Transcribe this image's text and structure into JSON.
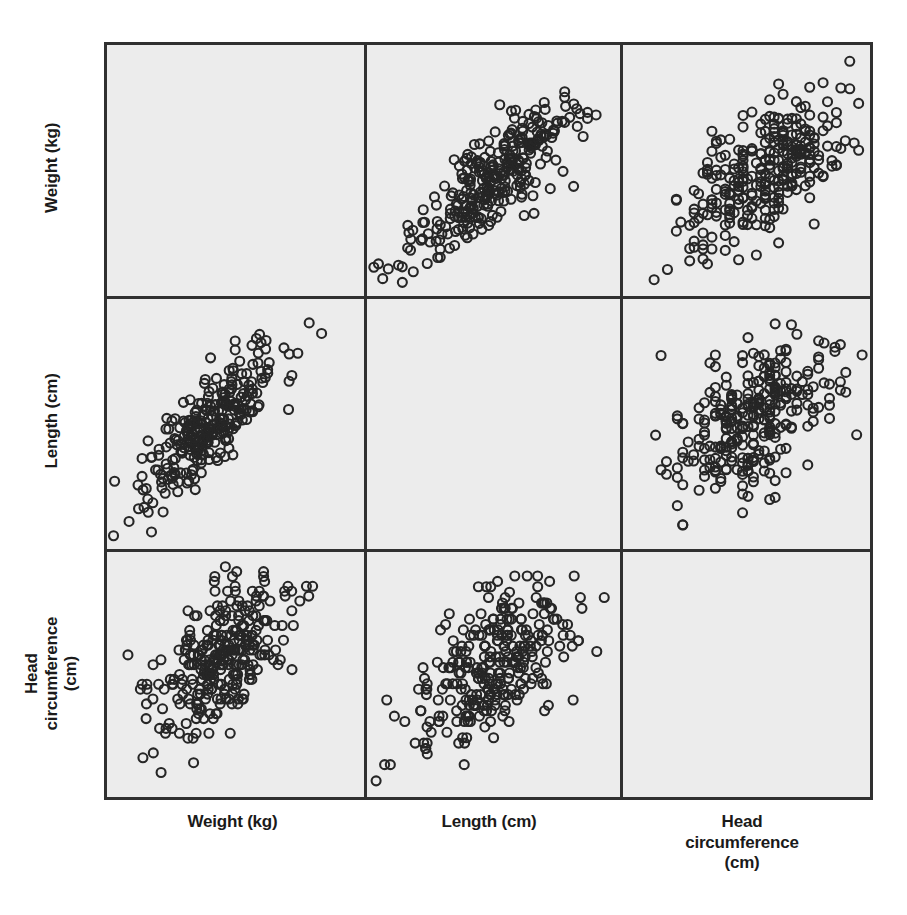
{
  "figure": {
    "type": "scatter-plot-matrix",
    "variables": [
      "Weight (kg)",
      "Length (cm)",
      "Head circumference (cm)"
    ],
    "panel_background": "#ececec",
    "frame_color": "#303030",
    "marker_color": "#262626",
    "marker_style": "open-circle",
    "page_background": "#ffffff"
  },
  "row_labels": [
    {
      "id": "weight",
      "text": "Weight (kg)",
      "lines": [
        "Weight (kg)"
      ]
    },
    {
      "id": "length",
      "text": "Length (cm)",
      "lines": [
        "Length (cm)"
      ]
    },
    {
      "id": "head",
      "text": "Head circumference (cm)",
      "lines": [
        "Head",
        "circumference (cm)"
      ]
    }
  ],
  "column_labels": [
    {
      "id": "weight",
      "text": "Weight (kg)",
      "lines": [
        "Weight (kg)"
      ]
    },
    {
      "id": "length",
      "text": "Length (cm)",
      "lines": [
        "Length (cm)"
      ]
    },
    {
      "id": "head",
      "text": "Head circumference (cm)",
      "lines": [
        "Head",
        "circumference",
        "(cm)"
      ]
    }
  ],
  "chart_data": {
    "type": "scatter",
    "title": "",
    "xlabel": "",
    "ylabel": "",
    "grid": false,
    "legend": false,
    "matrix": true,
    "n_points": 300,
    "variables": [
      "Weight (kg)",
      "Length (cm)",
      "Head circumference (cm)"
    ],
    "diagonal": "blank",
    "panels": [
      {
        "row": 0,
        "col": 0,
        "x_var": "Weight (kg)",
        "y_var": "Weight (kg)",
        "blank": true,
        "n": 0,
        "correlation": null,
        "note": "diagonal panel left empty"
      },
      {
        "row": 0,
        "col": 1,
        "x_var": "Length (cm)",
        "y_var": "Weight (kg)",
        "blank": false,
        "n": 300,
        "correlation": 0.85,
        "x_center": 0.52,
        "y_center": 0.5,
        "x_spread": 0.17,
        "y_spread": 0.17,
        "jitter_x": 0.0,
        "jitter_y": 0.0,
        "seed": 1101,
        "shape": "tight diagonal ellipse, strong positive"
      },
      {
        "row": 0,
        "col": 2,
        "x_var": "Head circumference (cm)",
        "y_var": "Weight (kg)",
        "blank": false,
        "n": 300,
        "correlation": 0.62,
        "x_center": 0.58,
        "y_center": 0.5,
        "x_spread": 0.17,
        "y_spread": 0.15,
        "jitter_x": 0.018,
        "jitter_y": 0.0,
        "seed": 2202,
        "shape": "broader cloud, moderate positive"
      },
      {
        "row": 1,
        "col": 0,
        "x_var": "Weight (kg)",
        "y_var": "Length (cm)",
        "blank": false,
        "n": 300,
        "correlation": 0.85,
        "x_center": 0.4,
        "y_center": 0.5,
        "x_spread": 0.15,
        "y_spread": 0.18,
        "jitter_x": 0.0,
        "jitter_y": 0.0,
        "seed": 3303,
        "shape": "tight diagonal ellipse, strong positive"
      },
      {
        "row": 1,
        "col": 1,
        "x_var": "Length (cm)",
        "y_var": "Length (cm)",
        "blank": true,
        "n": 0,
        "correlation": null,
        "note": "diagonal panel left empty"
      },
      {
        "row": 1,
        "col": 2,
        "x_var": "Head circumference (cm)",
        "y_var": "Length (cm)",
        "blank": false,
        "n": 300,
        "correlation": 0.6,
        "x_center": 0.52,
        "y_center": 0.52,
        "x_spread": 0.17,
        "y_spread": 0.17,
        "jitter_x": 0.022,
        "jitter_y": 0.0,
        "seed": 4404,
        "shape": "broad cloud with vertical banding, moderate positive"
      },
      {
        "row": 2,
        "col": 0,
        "x_var": "Weight (kg)",
        "y_var": "Head circumference (cm)",
        "blank": false,
        "n": 300,
        "correlation": 0.62,
        "x_center": 0.44,
        "y_center": 0.56,
        "x_spread": 0.13,
        "y_spread": 0.18,
        "jitter_x": 0.0,
        "jitter_y": 0.02,
        "seed": 5505,
        "shape": "vertically elongated cloud, moderate positive"
      },
      {
        "row": 2,
        "col": 1,
        "x_var": "Length (cm)",
        "y_var": "Head circumference (cm)",
        "blank": false,
        "n": 300,
        "correlation": 0.6,
        "x_center": 0.5,
        "y_center": 0.55,
        "x_spread": 0.16,
        "y_spread": 0.17,
        "jitter_x": 0.0,
        "jitter_y": 0.022,
        "seed": 6606,
        "shape": "broad cloud with horizontal banding, moderate positive"
      },
      {
        "row": 2,
        "col": 2,
        "x_var": "Head circumference (cm)",
        "y_var": "Head circumference (cm)",
        "blank": true,
        "n": 0,
        "correlation": null,
        "note": "diagonal panel left empty"
      }
    ]
  }
}
